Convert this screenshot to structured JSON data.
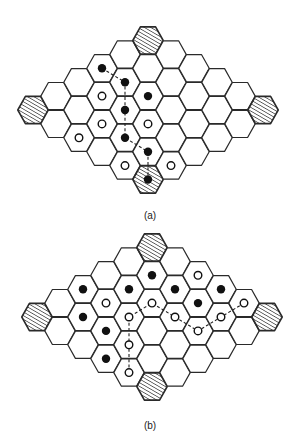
{
  "geometry": {
    "col_spacing": 23.0,
    "half_row_step": 13.9,
    "hex_corner_halfwidth": 15.2,
    "hex_top_halfwidth": 7.6,
    "hex_halfheight": 13.6,
    "columns": [
      {
        "col": 0,
        "ks": [
          0
        ]
      },
      {
        "col": 1,
        "ks": [
          -1,
          1
        ]
      },
      {
        "col": 2,
        "ks": [
          -2,
          0,
          2
        ]
      },
      {
        "col": 3,
        "ks": [
          -3,
          -1,
          1,
          3
        ]
      },
      {
        "col": 4,
        "ks": [
          -4,
          -2,
          0,
          2,
          4
        ]
      },
      {
        "col": 5,
        "ks": [
          -5,
          -3,
          -1,
          1,
          3,
          5
        ]
      },
      {
        "col": 6,
        "ks": [
          -4,
          -2,
          0,
          2,
          4
        ]
      },
      {
        "col": 7,
        "ks": [
          -3,
          -1,
          1,
          3
        ]
      },
      {
        "col": 8,
        "ks": [
          -2,
          0,
          2
        ]
      },
      {
        "col": 9,
        "ks": [
          -1,
          1
        ]
      },
      {
        "col": 10,
        "ks": [
          0
        ]
      }
    ],
    "hatched_cells": [
      [
        0,
        0
      ],
      [
        10,
        0
      ],
      [
        5,
        -5
      ],
      [
        5,
        5
      ]
    ],
    "colors": {
      "stroke": "#2a2a2a",
      "hatch": "#2a2a2a",
      "fill": "#ffffff",
      "black_stone": "#111111"
    }
  },
  "diagrams": [
    {
      "id": "a",
      "caption": "(a)",
      "origin": [
        33,
        110
      ],
      "caption_y": 216,
      "black_stones": [
        [
          3,
          -3
        ],
        [
          4,
          -2
        ],
        [
          5,
          -1
        ],
        [
          4,
          0
        ],
        [
          4,
          2
        ],
        [
          5,
          3
        ],
        [
          5,
          5
        ]
      ],
      "white_stones": [
        [
          3,
          -1
        ],
        [
          3,
          1
        ],
        [
          2,
          2
        ],
        [
          5,
          1
        ],
        [
          4,
          4
        ],
        [
          6,
          4
        ]
      ],
      "path": [
        [
          3,
          -3
        ],
        [
          4,
          -2
        ],
        [
          4,
          0
        ],
        [
          4,
          2
        ],
        [
          5,
          3
        ],
        [
          5,
          5
        ]
      ],
      "path_color": "black"
    },
    {
      "id": "b",
      "caption": "(b)",
      "origin": [
        37,
        92
      ],
      "caption_y": 201,
      "black_stones": [
        [
          2,
          -2
        ],
        [
          2,
          0
        ],
        [
          3,
          1
        ],
        [
          3,
          3
        ],
        [
          4,
          -2
        ],
        [
          5,
          -3
        ],
        [
          6,
          -2
        ],
        [
          7,
          -1
        ],
        [
          8,
          -2
        ]
      ],
      "white_stones": [
        [
          3,
          -1
        ],
        [
          4,
          0
        ],
        [
          4,
          2
        ],
        [
          4,
          4
        ],
        [
          5,
          -1
        ],
        [
          6,
          0
        ],
        [
          7,
          -3
        ],
        [
          7,
          1
        ],
        [
          8,
          0
        ],
        [
          9,
          -1
        ]
      ],
      "path": [
        [
          4,
          4
        ],
        [
          4,
          2
        ],
        [
          4,
          0
        ],
        [
          5,
          -1
        ],
        [
          6,
          0
        ],
        [
          7,
          1
        ],
        [
          8,
          0
        ],
        [
          9,
          -1
        ]
      ],
      "path_color": "white"
    }
  ]
}
